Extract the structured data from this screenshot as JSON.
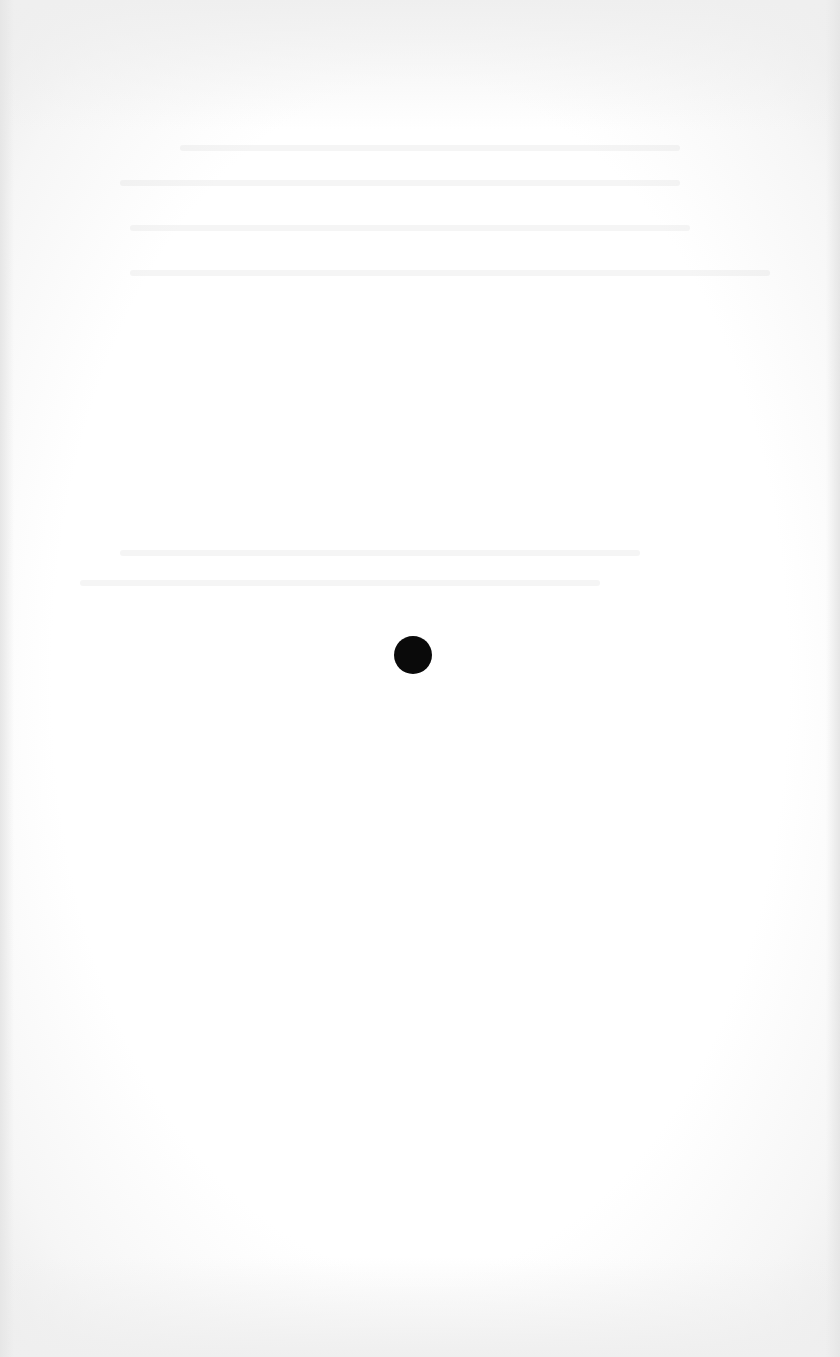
{
  "page": {
    "type": "scanned-blank-page",
    "background_color": "#ffffff",
    "text_content": "",
    "marks": [
      {
        "kind": "dot",
        "color": "#0a0a0a",
        "center_x": 413,
        "center_y": 655,
        "diameter": 38
      }
    ],
    "bleed_through_lines_approx_y": [
      145,
      180,
      225,
      270,
      550,
      580
    ]
  }
}
